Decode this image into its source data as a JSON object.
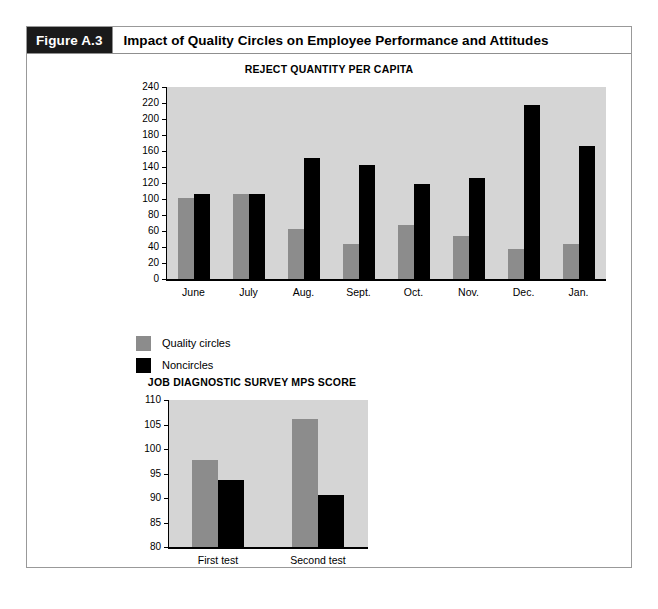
{
  "figure": {
    "tag": "Figure A.3",
    "title": "Impact of Quality Circles on Employee Performance and Attitudes"
  },
  "legend": {
    "items": [
      {
        "label": "Quality circles",
        "color": "#8c8c8c",
        "swatch_name": "legend-swatch-quality-circles"
      },
      {
        "label": "Noncircles",
        "color": "#000000",
        "swatch_name": "legend-swatch-noncircles"
      }
    ]
  },
  "chart_data": [
    {
      "id": "reject-quantity-per-capita",
      "type": "bar",
      "title": "REJECT QUANTITY PER CAPITA",
      "xlabel": "",
      "ylabel": "",
      "ylim": [
        0,
        240
      ],
      "ytick_step": 20,
      "yticks": [
        240,
        220,
        200,
        180,
        160,
        140,
        120,
        100,
        80,
        60,
        40,
        20,
        0
      ],
      "categories": [
        "June",
        "July",
        "Aug.",
        "Sept.",
        "Oct.",
        "Nov.",
        "Dec.",
        "Jan."
      ],
      "grid": false,
      "legend_position": "below-left",
      "series": [
        {
          "name": "Quality circles",
          "color": "#8c8c8c",
          "values": [
            101,
            106,
            63,
            44,
            68,
            54,
            38,
            44
          ]
        },
        {
          "name": "Noncircles",
          "color": "#000000",
          "values": [
            106,
            106,
            151,
            143,
            119,
            126,
            217,
            166
          ]
        }
      ]
    },
    {
      "id": "job-diagnostic-survey-mps-score",
      "type": "bar",
      "title": "JOB DIAGNOSTIC SURVEY MPS SCORE",
      "xlabel": "",
      "ylabel": "",
      "ylim": [
        80,
        110
      ],
      "ytick_step": 5,
      "yticks": [
        110,
        105,
        100,
        95,
        90,
        85,
        80
      ],
      "categories": [
        "First test",
        "Second test"
      ],
      "grid": false,
      "legend_position": "none",
      "series": [
        {
          "name": "Quality circles",
          "color": "#8c8c8c",
          "values": [
            97.8,
            106.2
          ]
        },
        {
          "name": "Noncircles",
          "color": "#000000",
          "values": [
            93.7,
            90.6
          ]
        }
      ]
    }
  ]
}
